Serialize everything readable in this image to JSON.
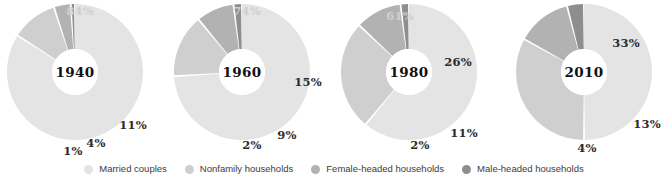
{
  "legend": {
    "items": [
      {
        "label": "Married couples",
        "color": "#e4e4e4",
        "key": "married"
      },
      {
        "label": "Nonfamily households",
        "color": "#cfcfcf",
        "key": "nonfamily"
      },
      {
        "label": "Female-headed households",
        "color": "#b2b2b2",
        "key": "female"
      },
      {
        "label": "Male-headed households",
        "color": "#8e8e8e",
        "key": "male"
      }
    ]
  },
  "chart_data": {
    "type": "pie",
    "title": "",
    "legend_position": "bottom",
    "categories": [
      "Married couples",
      "Nonfamily households",
      "Female-headed households",
      "Male-headed households"
    ],
    "colors": [
      "#e4e4e4",
      "#cfcfcf",
      "#b2b2b2",
      "#8e8e8e"
    ],
    "charts": [
      {
        "center_label": "1940",
        "values": [
          84,
          11,
          4,
          1
        ],
        "labels": [
          "84%",
          "11%",
          "4%",
          "1%"
        ]
      },
      {
        "center_label": "1960",
        "values": [
          74,
          15,
          9,
          2
        ],
        "labels": [
          "74%",
          "15%",
          "9%",
          "2%"
        ]
      },
      {
        "center_label": "1980",
        "values": [
          61,
          26,
          11,
          2
        ],
        "labels": [
          "61%",
          "26%",
          "11%",
          "2%"
        ]
      },
      {
        "center_label": "2010",
        "values": [
          50,
          33,
          13,
          4
        ],
        "labels": [
          "50%",
          "33%",
          "13%",
          "4%"
        ]
      }
    ]
  },
  "charts_layout": [
    {
      "id": "chart-1940",
      "left": 0,
      "center_label": "1940",
      "center_label_pos": {
        "x": 75,
        "y": 72
      },
      "labels": [
        {
          "text": "84%",
          "x": 80,
          "y": 11,
          "tone": "light"
        },
        {
          "text": "11%",
          "x": 133,
          "y": 125,
          "tone": "dark"
        },
        {
          "text": "4%",
          "x": 96,
          "y": 143,
          "tone": "dark"
        },
        {
          "text": "1%",
          "x": 73,
          "y": 151,
          "tone": "dark"
        }
      ]
    },
    {
      "id": "chart-1960",
      "left": 167,
      "center_label": "1960",
      "center_label_pos": {
        "x": 75,
        "y": 72
      },
      "labels": [
        {
          "text": "74%",
          "x": 80,
          "y": 11,
          "tone": "light"
        },
        {
          "text": "15%",
          "x": 141,
          "y": 82,
          "tone": "dark"
        },
        {
          "text": "9%",
          "x": 120,
          "y": 135,
          "tone": "dark"
        },
        {
          "text": "2%",
          "x": 85,
          "y": 145,
          "tone": "dark"
        }
      ]
    },
    {
      "id": "chart-1980",
      "left": 334,
      "center_label": "1980",
      "center_label_pos": {
        "x": 75,
        "y": 72
      },
      "labels": [
        {
          "text": "61%",
          "x": 66,
          "y": 16,
          "tone": "light"
        },
        {
          "text": "26%",
          "x": 124,
          "y": 62,
          "tone": "dark"
        },
        {
          "text": "11%",
          "x": 130,
          "y": 133,
          "tone": "dark"
        },
        {
          "text": "2%",
          "x": 86,
          "y": 145,
          "tone": "dark"
        }
      ]
    },
    {
      "id": "chart-2010",
      "left": 501,
      "center_label": "2010",
      "center_label_pos": {
        "x": 83,
        "y": 72
      },
      "labels": [
        {
          "text": "50%",
          "x": 39,
          "y": 63,
          "tone": "light"
        },
        {
          "text": "33%",
          "x": 125,
          "y": 43,
          "tone": "dark"
        },
        {
          "text": "13%",
          "x": 146,
          "y": 124,
          "tone": "dark"
        },
        {
          "text": "4%",
          "x": 86,
          "y": 148,
          "tone": "dark"
        }
      ]
    }
  ],
  "geometry": {
    "radius": 68,
    "inner_radius": 23,
    "center_y": 72,
    "center_x_default": 75,
    "center_x_last": 83,
    "gap_degrees": 1.6,
    "background": "#ffffff",
    "hole_color": "#ffffff"
  }
}
